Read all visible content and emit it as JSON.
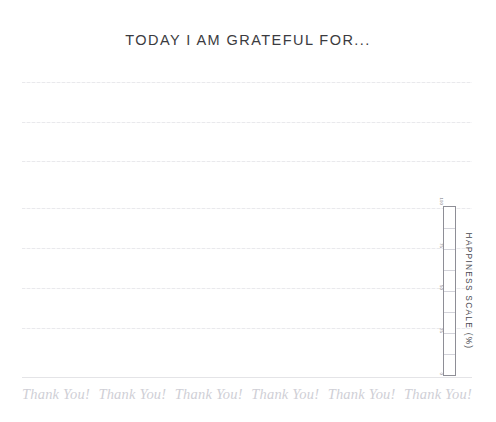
{
  "page": {
    "background_color": "#ffffff",
    "title": "TODAY I AM GRATEFUL FOR...",
    "title_color": "#3b3b40"
  },
  "writing_lines": {
    "count": 8,
    "line_color": "#e9e9ec",
    "positions_y": [
      82,
      122,
      161,
      208,
      248,
      288,
      328,
      377
    ],
    "styles": [
      "dotted",
      "dotted",
      "dotted",
      "dotted",
      "dotted",
      "dotted",
      "dotted",
      "solid"
    ]
  },
  "happiness_scale": {
    "caption": "HAPPINESS SCALE (%)",
    "caption_color": "#4a4a51",
    "tube_border_color": "#8e8e96",
    "segment_count": 8,
    "ticks": [
      {
        "label": "100",
        "value": 100,
        "pos_pct": 0
      },
      {
        "label": "75",
        "value": 75,
        "pos_pct": 25
      },
      {
        "label": "50",
        "value": 50,
        "pos_pct": 50
      },
      {
        "label": "25",
        "value": 25,
        "pos_pct": 75
      },
      {
        "label": "0",
        "value": 0,
        "pos_pct": 100
      }
    ],
    "fill_level": 0
  },
  "footer": {
    "thanks_color": "#cfcfd6",
    "items": [
      {
        "text": "Thank You!"
      },
      {
        "text": "Thank You!"
      },
      {
        "text": "Thank You!"
      },
      {
        "text": "Thank You!"
      },
      {
        "text": "Thank You!"
      },
      {
        "text": "Thank You!"
      }
    ]
  }
}
